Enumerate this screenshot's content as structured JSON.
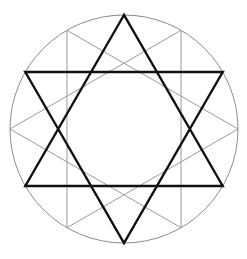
{
  "figure": {
    "type": "geometric-line-drawing",
    "canvas": {
      "width": 247,
      "height": 259,
      "background": "#ffffff"
    },
    "center": {
      "x": 124,
      "y": 129
    },
    "radius": 114,
    "colors": {
      "background": "#ffffff",
      "circle_stroke": "#8c8c8c",
      "primary_star_stroke": "#111111",
      "secondary_star_stroke": "#9a9a9a"
    },
    "stroke_widths": {
      "circle": 1,
      "primary_star": 2.4,
      "secondary_star": 1
    },
    "circle": {
      "label": "circumscribed circle",
      "cx": 124,
      "cy": 129,
      "r": 114,
      "stroke": "#8c8c8c",
      "stroke_width": 1,
      "fill": "none"
    },
    "primary_star": {
      "label": "thick hexagram (vertical orientation)",
      "stroke": "#111111",
      "stroke_width": 2.4,
      "vertex_angles_deg": [
        90,
        150,
        210,
        270,
        330,
        30
      ],
      "vertices": [
        {
          "name": "top",
          "angle": 90,
          "x": 124,
          "y": 15
        },
        {
          "name": "upper-left",
          "angle": 150,
          "x": 25.3,
          "y": 72
        },
        {
          "name": "lower-left",
          "angle": 210,
          "x": 25.3,
          "y": 186
        },
        {
          "name": "bottom",
          "angle": 270,
          "x": 124,
          "y": 243
        },
        {
          "name": "lower-right",
          "angle": 330,
          "x": 222.7,
          "y": 186
        },
        {
          "name": "upper-right",
          "angle": 30,
          "x": 222.7,
          "y": 72
        }
      ],
      "triangles": [
        {
          "name": "upward-triangle",
          "vertex_indices": [
            0,
            2,
            4
          ]
        },
        {
          "name": "downward-triangle",
          "vertex_indices": [
            1,
            3,
            5
          ]
        }
      ]
    },
    "secondary_star": {
      "label": "thin hexagram (rotated 30 degrees)",
      "stroke": "#9a9a9a",
      "stroke_width": 1,
      "vertex_angles_deg": [
        60,
        120,
        180,
        240,
        300,
        0
      ],
      "vertices": [
        {
          "name": "upper-right-thin",
          "angle": 60,
          "x": 181,
          "y": 30.3
        },
        {
          "name": "upper-left-thin",
          "angle": 120,
          "x": 67,
          "y": 30.3
        },
        {
          "name": "left-thin",
          "angle": 180,
          "x": 10,
          "y": 129
        },
        {
          "name": "lower-left-thin",
          "angle": 240,
          "x": 67,
          "y": 227.7
        },
        {
          "name": "lower-right-thin",
          "angle": 300,
          "x": 181,
          "y": 227.7
        },
        {
          "name": "right-thin",
          "angle": 0,
          "x": 238,
          "y": 129
        }
      ],
      "triangles": [
        {
          "name": "left-pointing-triangle",
          "vertex_indices": [
            0,
            2,
            4
          ]
        },
        {
          "name": "right-pointing-triangle",
          "vertex_indices": [
            1,
            3,
            5
          ]
        }
      ]
    },
    "inner_void": {
      "label": "central empty dodecagonal region",
      "filled": false
    }
  }
}
